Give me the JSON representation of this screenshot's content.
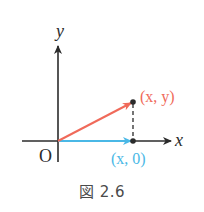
{
  "figure": {
    "caption": "図 2.6",
    "axes": {
      "x_label": "x",
      "y_label": "y",
      "origin_label": "O",
      "axis_color": "#2b2b2b"
    },
    "points": {
      "p": {
        "label": "(x, y)",
        "color": "#f06a5a"
      },
      "q": {
        "label": "(x, 0)",
        "color": "#4ab8e6"
      }
    },
    "vectors": [
      {
        "name": "vector-to-xy",
        "from": "O",
        "to": "(x, y)",
        "color": "#f06a5a"
      },
      {
        "name": "vector-to-x0",
        "from": "O",
        "to": "(x, 0)",
        "color": "#4ab8e6"
      }
    ],
    "projection_line": {
      "style": "dashed",
      "from": "(x, y)",
      "to": "(x, 0)",
      "color": "#2b2b2b"
    }
  }
}
